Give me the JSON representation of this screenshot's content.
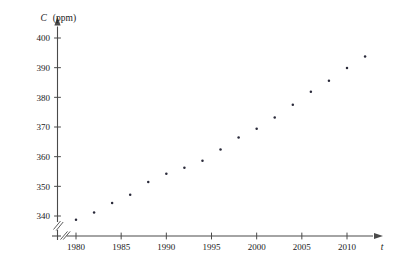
{
  "chart_data": {
    "type": "scatter",
    "title": "",
    "subtitle": "",
    "xlabel": "t",
    "ylabel": "C",
    "yunits": "(ppm)",
    "ylabel_full": "C (ppm)",
    "xlim": [
      1978.0,
      2013.5
    ],
    "ylim": [
      335.0,
      403.0
    ],
    "grid": false,
    "legend": null,
    "axis_break_x": true,
    "axis_break_y": true,
    "xticks": [
      1980,
      1985,
      1990,
      1995,
      2000,
      2005,
      2010
    ],
    "xticklabels": [
      "1980",
      "1985",
      "1990",
      "1995",
      "2000",
      "2005",
      "2010"
    ],
    "yticks": [
      340,
      350,
      360,
      370,
      380,
      390,
      400
    ],
    "yticklabels": [
      "340",
      "350",
      "360",
      "370",
      "380",
      "390",
      "400"
    ],
    "series": [
      {
        "name": "CO2 concentration",
        "marker": "dot",
        "color": "#2a2a3a",
        "x": [
          1980,
          1982,
          1984,
          1986,
          1988,
          1990,
          1992,
          1994,
          1996,
          1998,
          2000,
          2002,
          2004,
          2006,
          2008,
          2010,
          2012
        ],
        "y": [
          338.7,
          341.2,
          344.4,
          347.2,
          351.5,
          354.2,
          356.3,
          358.6,
          362.4,
          366.5,
          369.4,
          373.2,
          377.5,
          381.9,
          385.6,
          389.9,
          393.8
        ]
      }
    ],
    "axis_colors": {
      "axis": "#4a4a4a",
      "point": "#2a2a3a",
      "text": "#1a1a1a",
      "background": "#ffffff"
    }
  }
}
